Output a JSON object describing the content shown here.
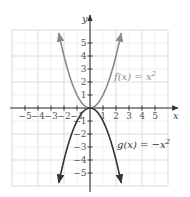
{
  "chart_data": {
    "type": "line",
    "title": "",
    "xlabel": "x",
    "ylabel": "y",
    "xlim": [
      -6,
      6
    ],
    "ylim": [
      -6,
      6
    ],
    "grid": true,
    "x_ticks": [
      -5,
      -4,
      -3,
      -2,
      -1,
      1,
      2,
      3,
      4,
      5
    ],
    "y_ticks": [
      -5,
      -4,
      -3,
      -2,
      -1,
      1,
      2,
      3,
      4,
      5
    ],
    "x_tick_labels": [
      "−5",
      "−4",
      "−3",
      "−2",
      "−1",
      "1",
      "2",
      "3",
      "4",
      "5"
    ],
    "y_tick_labels": [
      "−5",
      "−4",
      "−3",
      "−2",
      "−1",
      "1",
      "2",
      "3",
      "4",
      "5"
    ],
    "legend_position": "inline-annotations",
    "series": [
      {
        "name": "f(x) = x²",
        "label_text": "f(x) = x",
        "label_sup": "2",
        "expression": "x^2",
        "color": "#8a8a8a",
        "x": [
          -2.4,
          -2,
          -1.5,
          -1,
          -0.5,
          0,
          0.5,
          1,
          1.5,
          2,
          2.4
        ],
        "values": [
          5.76,
          4,
          2.25,
          1,
          0.25,
          0,
          0.25,
          1,
          2.25,
          4,
          5.76
        ],
        "arrows": "both-ends"
      },
      {
        "name": "g(x) = −x²",
        "label_text": "g(x) = −x",
        "label_sup": "2",
        "expression": "-x^2",
        "color": "#333333",
        "x": [
          -2.4,
          -2,
          -1.5,
          -1,
          -0.5,
          0,
          0.5,
          1,
          1.5,
          2,
          2.4
        ],
        "values": [
          -5.76,
          -4,
          -2.25,
          -1,
          -0.25,
          0,
          -0.25,
          -1,
          -2.25,
          -4,
          -5.76
        ],
        "arrows": "both-ends"
      }
    ],
    "annotations": [
      {
        "text": "f(x) = x²",
        "near": [
          2.6,
          2
        ]
      },
      {
        "text": "g(x) = −x²",
        "near": [
          2.6,
          -2.5
        ]
      }
    ]
  },
  "layout": {
    "origin_px": [
      90,
      108
    ],
    "unit_px": 13,
    "grid_color_minor": "#ececec",
    "grid_color_major": "#dcdcdc",
    "axis_color": "#333333"
  }
}
